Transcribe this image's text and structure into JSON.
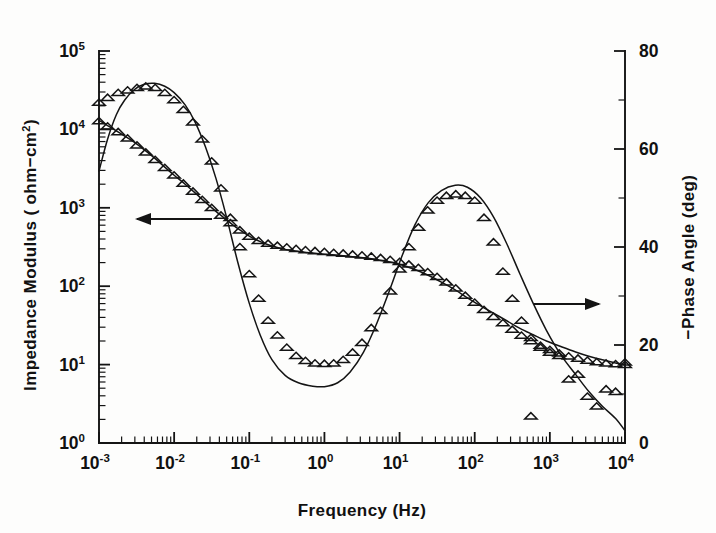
{
  "figure": {
    "background_color": "#fdfdfc",
    "ink_color": "#141414",
    "caption_note": ""
  },
  "axes": {
    "x": {
      "title_main": "Frequency (Hz)",
      "scale": "log",
      "min_exp": -3,
      "max_exp": 4,
      "tick_labels": [
        "10-3",
        "10-2",
        "10-1",
        "100",
        "101",
        "102",
        "103",
        "104"
      ],
      "tick_mantissa": "10",
      "tick_exponents": [
        "-3",
        "-2",
        "-1",
        "0",
        "1",
        "2",
        "3",
        "4"
      ]
    },
    "y_left": {
      "title_prefix": "Impedance Modulus ( ohm−cm",
      "title_sup": "2",
      "title_suffix": ")",
      "scale": "log",
      "min_exp": 0,
      "max_exp": 5,
      "tick_mantissa": "10",
      "tick_exponents": [
        "0",
        "1",
        "2",
        "3",
        "4",
        "5"
      ]
    },
    "y_right": {
      "title": "−Phase Angle (deg)",
      "scale": "linear",
      "min": 0,
      "max": 80,
      "tick_labels": [
        "0",
        "20",
        "40",
        "60",
        "80"
      ],
      "tick_values": [
        0,
        20,
        40,
        60,
        80
      ]
    }
  },
  "annotations": [
    {
      "name": "left-pointing-arrow",
      "direction": "left",
      "meaning": "impedance modulus series reads left axis",
      "x_start_px": 212,
      "x_end_px": 135,
      "y_px": 219
    },
    {
      "name": "right-pointing-arrow",
      "direction": "right",
      "meaning": "phase angle series reads right axis",
      "x_start_px": 533,
      "x_end_px": 601,
      "y_px": 304
    }
  ],
  "chart_data": {
    "type": "line",
    "title": "",
    "subtitle": "",
    "xlabel": "Frequency (Hz)",
    "ylabel": "Impedance Modulus ( ohm-cm2)",
    "y2label": "-Phase Angle (deg)",
    "xscale": "log",
    "yscale": "log",
    "xlim": [
      0.001,
      10000
    ],
    "ylim": [
      1,
      100000
    ],
    "y2lim": [
      0,
      80
    ],
    "grid": false,
    "legend": "none",
    "legend_entries": [],
    "marker": "open-triangle-up",
    "series": [
      {
        "name": "Impedance modulus model fit",
        "axis": "left",
        "style": "solid-line",
        "units": "ohm-cm2",
        "x": [
          0.001,
          0.0013,
          0.0017,
          0.0022,
          0.003,
          0.004,
          0.0055,
          0.0075,
          0.01,
          0.014,
          0.019,
          0.026,
          0.036,
          0.05,
          0.07,
          0.1,
          0.14,
          0.2,
          0.3,
          0.45,
          0.7,
          1.0,
          1.5,
          2.2,
          3.3,
          5.0,
          7.5,
          11.0,
          16.0,
          24.0,
          36.0,
          55.0,
          80.0,
          120.0,
          180.0,
          270.0,
          400.0,
          600.0,
          900.0,
          1400.0,
          2200.0,
          3300.0,
          5000.0,
          7500.0,
          10000.0
        ],
        "y": [
          13000,
          11200,
          9600,
          8200,
          6800,
          5500,
          4300,
          3300,
          2600,
          2000,
          1550,
          1180,
          900,
          700,
          545,
          435,
          370,
          325,
          295,
          278,
          265,
          256,
          248,
          240,
          230,
          218,
          203,
          185,
          163,
          138,
          113,
          90,
          71,
          56,
          45,
          36,
          29,
          24,
          20,
          17,
          14.5,
          12.8,
          11.5,
          10.5,
          10.0
        ]
      },
      {
        "name": "Impedance modulus data",
        "axis": "left",
        "style": "markers",
        "units": "ohm-cm2",
        "x": [
          0.001,
          0.0013,
          0.0018,
          0.0024,
          0.0032,
          0.0042,
          0.0056,
          0.0075,
          0.01,
          0.0133,
          0.0178,
          0.0237,
          0.0316,
          0.042,
          0.056,
          0.075,
          0.1,
          0.133,
          0.178,
          0.237,
          0.316,
          0.42,
          0.56,
          0.75,
          1.0,
          1.33,
          1.78,
          2.37,
          3.16,
          4.2,
          5.6,
          7.5,
          10.0,
          13.3,
          17.8,
          23.7,
          31.6,
          42.0,
          56.0,
          75.0,
          100.0,
          133.0,
          178.0,
          237.0,
          316.0,
          420.0,
          560.0,
          750.0,
          1000.0,
          1330.0,
          1780.0,
          2370.0,
          3160.0,
          4200.0,
          5600.0,
          7500.0,
          10000.0
        ],
        "y": [
          12800,
          11000,
          9300,
          7700,
          6300,
          5100,
          4100,
          3250,
          2600,
          2050,
          1620,
          1270,
          1000,
          800,
          640,
          520,
          430,
          380,
          350,
          330,
          315,
          300,
          290,
          282,
          275,
          268,
          262,
          255,
          248,
          240,
          230,
          218,
          205,
          190,
          172,
          152,
          132,
          112,
          94,
          76,
          62,
          50,
          41,
          34,
          28,
          23.5,
          20,
          17.5,
          15.5,
          14,
          12.8,
          12,
          11.3,
          10.8,
          10.4,
          10.2,
          10.0
        ]
      },
      {
        "name": "Phase angle model fit",
        "axis": "right",
        "style": "solid-line",
        "units": "deg",
        "x": [
          0.001,
          0.0013,
          0.0017,
          0.0022,
          0.003,
          0.004,
          0.0055,
          0.0075,
          0.01,
          0.014,
          0.019,
          0.026,
          0.036,
          0.05,
          0.07,
          0.1,
          0.14,
          0.2,
          0.3,
          0.45,
          0.7,
          1.0,
          1.5,
          2.2,
          3.3,
          5.0,
          7.5,
          11.0,
          16.0,
          24.0,
          36.0,
          55.0,
          80.0,
          120.0,
          180.0,
          270.0,
          400.0,
          600.0,
          900.0,
          1400.0,
          2200.0,
          3300.0,
          5000.0,
          7500.0,
          10000.0
        ],
        "y": [
          55.5,
          62.0,
          67.0,
          70.0,
          72.2,
          73.2,
          73.4,
          72.8,
          71.5,
          69.0,
          65.5,
          60.5,
          54.0,
          46.0,
          37.0,
          28.5,
          22.0,
          17.0,
          13.8,
          12.3,
          11.6,
          11.5,
          12.3,
          14.5,
          18.5,
          24.5,
          31.5,
          38.5,
          44.5,
          49.0,
          51.5,
          52.6,
          52.2,
          50.0,
          46.0,
          40.5,
          34.5,
          28.5,
          23.0,
          18.0,
          14.0,
          10.5,
          7.5,
          5.0,
          2.5
        ]
      },
      {
        "name": "Phase angle data",
        "axis": "right",
        "style": "markers",
        "units": "deg",
        "x": [
          0.001,
          0.0013,
          0.0018,
          0.0024,
          0.0032,
          0.0042,
          0.0056,
          0.0075,
          0.01,
          0.0133,
          0.0178,
          0.0237,
          0.0316,
          0.042,
          0.056,
          0.075,
          0.1,
          0.133,
          0.178,
          0.237,
          0.316,
          0.42,
          0.56,
          0.75,
          1.0,
          1.33,
          1.78,
          2.37,
          3.16,
          4.2,
          5.6,
          7.5,
          10.0,
          13.3,
          17.8,
          23.7,
          31.6,
          42.0,
          56.0,
          75.0,
          100.0,
          133.0,
          178.0,
          237.0,
          316.0,
          420.0,
          560.0,
          750.0,
          1000.0,
          1330.0,
          1780.0,
          2370.0,
          3160.0,
          4200.0,
          5600.0,
          7500.0,
          10000.0
        ],
        "y": [
          69.5,
          70.5,
          71.5,
          72.0,
          72.5,
          72.8,
          72.5,
          71.5,
          70.0,
          68.0,
          65.5,
          62.0,
          57.5,
          52.0,
          46.0,
          40.0,
          34.5,
          29.5,
          25.0,
          22.0,
          19.5,
          17.8,
          16.8,
          16.3,
          16.2,
          16.3,
          17.0,
          18.5,
          20.5,
          23.5,
          27.0,
          31.0,
          35.5,
          40.0,
          44.0,
          47.5,
          49.5,
          50.5,
          50.8,
          50.5,
          49.5,
          46.0,
          41.0,
          35.0,
          29.5,
          25.0,
          21.5,
          19.5,
          18.5,
          17.8,
          13.0,
          14.0,
          9.5,
          7.5,
          11.0,
          10.5,
          16.5
        ],
        "outlier_x": [
          560.0
        ],
        "outlier_y": [
          5.5
        ]
      }
    ]
  }
}
